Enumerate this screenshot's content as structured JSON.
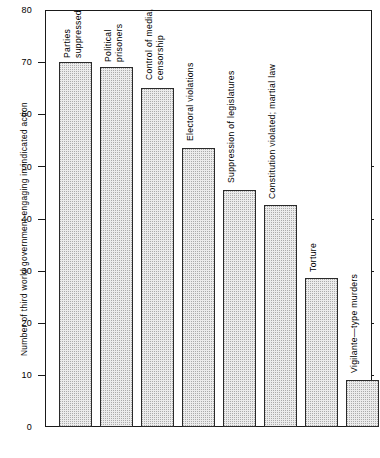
{
  "chart_data": {
    "type": "bar",
    "title": "",
    "subtitle": "",
    "xlabel": "",
    "ylabel": "Number of third world government engaging in indicated action",
    "ylim": [
      0,
      80
    ],
    "ytick_labels": [
      "80",
      "70",
      "60",
      "50",
      "40",
      "30",
      "20",
      "10",
      "0"
    ],
    "ytick_values": [
      80,
      70,
      60,
      50,
      40,
      30,
      20,
      10,
      0
    ],
    "grid": false,
    "legend": false,
    "legend_position": "none",
    "categories": [
      "Parties suppressed",
      "Political prisoners",
      "Control of media, censorship",
      "Electoral violations",
      "Suppression of legislatures",
      "Constitution violated; martial law",
      "Torture",
      "Vigilante—type murders"
    ],
    "values": [
      70,
      69,
      65,
      53.5,
      45.5,
      42.5,
      28.5,
      9
    ],
    "bar_label_lines": [
      [
        "Parties",
        "suppressed"
      ],
      [
        "Political",
        "prisoners"
      ],
      [
        "Control of media,",
        "censorship"
      ],
      [
        "Electoral violations"
      ],
      [
        "Suppression of legislatures"
      ],
      [
        "Constitution violated; martial law"
      ],
      [
        "Torture"
      ],
      [
        "Vigilante—type murders"
      ]
    ],
    "bar_fill_color": "#ececec",
    "bar_edge_color": "#2a2a2a",
    "axis_color": "#1a1a1a",
    "background_color": "#ffffff"
  }
}
